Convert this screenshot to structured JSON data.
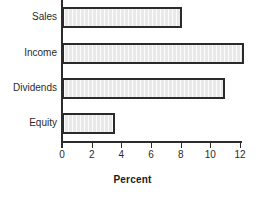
{
  "chart_data": {
    "type": "bar",
    "orientation": "horizontal",
    "title": "",
    "xlabel": "Percent",
    "ylabel": "",
    "categories": [
      "Sales",
      "Income",
      "Dividends",
      "Equity"
    ],
    "values": [
      8.1,
      12.3,
      11.0,
      3.6
    ],
    "xlim": [
      0,
      12.3
    ],
    "xticks": [
      "0",
      "2",
      "4",
      "6",
      "8",
      "10",
      "12"
    ],
    "xtick_values": [
      0,
      2,
      4,
      6,
      8,
      10,
      12
    ],
    "grid": false,
    "legend": null,
    "bar_fill_color": "#e9e9e9",
    "bar_border_color": "#2b2b2b",
    "axis_color": "#2b2b2b",
    "background_color": "#ffffff"
  }
}
